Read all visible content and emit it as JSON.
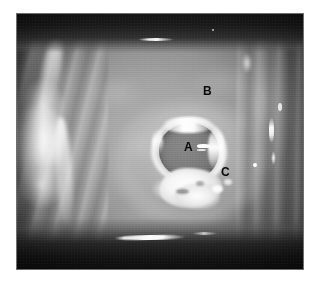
{
  "figure": {
    "kind": "endoscopic-photograph",
    "modality": "grayscale endoscopy still",
    "alt": "Grayscale endoscopic photograph of a mucosal surface showing a central crater-like ulcer with a raised white exudate rim, bright mucosal folds at the left and right walls, and dark luminal bands across the top and bottom.",
    "labels": [
      {
        "id": "a",
        "text": "A",
        "describes": "ulcer crater base"
      },
      {
        "id": "b",
        "text": "B",
        "describes": "surrounding mucosa"
      },
      {
        "id": "c",
        "text": "C",
        "describes": "exudate / slough margin"
      }
    ],
    "colors": {
      "mucosa_mid_gray": "#9a9a9a",
      "mucosa_light_gray": "#a6a6a6",
      "crater_interior_gray": "#727272",
      "exudate_white": "#ffffff",
      "luminal_band_black": "#141414",
      "label_text": "#0a0a0a",
      "page_background": "#ffffff",
      "frame_outline": "#6e6e6e"
    },
    "regions": {
      "top_band": "dark luminal shadow with specular streak",
      "bottom_band": "dark luminal shadow with curved specular streak",
      "left_wall": "bright obliquely lit mucosal folds",
      "right_wall": "vertical mucosal folds with point highlights",
      "center": "ulcerated crater with white rim and inferior exudate plaque"
    }
  },
  "caption": {
    "text": ""
  }
}
